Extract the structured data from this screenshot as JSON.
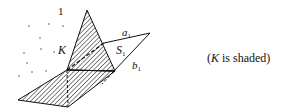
{
  "diagram": {
    "labels": {
      "one": "1",
      "K": "K",
      "a": "a",
      "a_sub": "1",
      "S": "S",
      "S_sub": "1",
      "b": "b",
      "b_sub": "1"
    },
    "caption": {
      "open": "(",
      "K": "K",
      "rest": " is shaded)"
    },
    "colors": {
      "stroke": "#111111",
      "hatch": "#222222",
      "background": "#ffffff",
      "dots": "#555555"
    }
  }
}
